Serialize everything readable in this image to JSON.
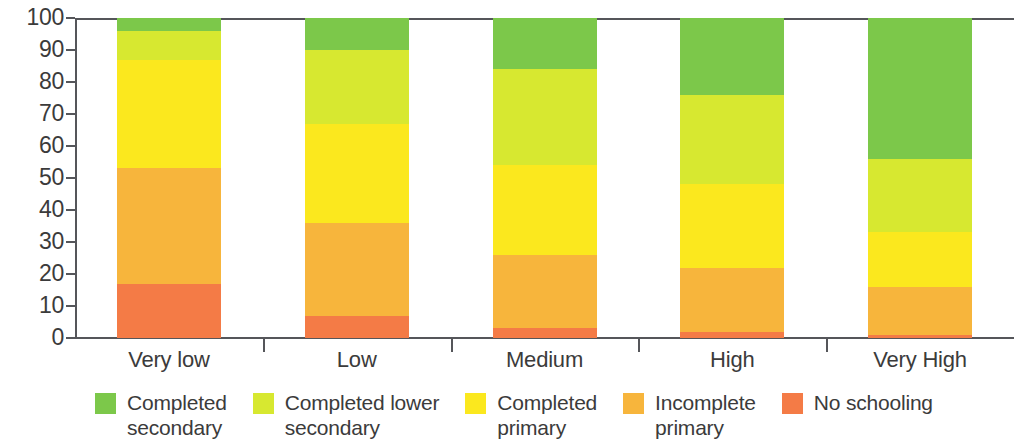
{
  "chart_data": {
    "type": "bar",
    "subtype": "stacked-bar-100",
    "title": "",
    "xlabel": "",
    "ylabel": "",
    "ylim": [
      0,
      100
    ],
    "ytick_step": 10,
    "yticks": [
      0,
      10,
      20,
      30,
      40,
      50,
      60,
      70,
      80,
      90,
      100
    ],
    "ytick_labels": [
      "0",
      "10",
      "20",
      "30",
      "40",
      "50",
      "60",
      "70",
      "80",
      "90",
      "100"
    ],
    "grid": false,
    "legend_position": "bottom",
    "categories": [
      "Very low",
      "Low",
      "Medium",
      "High",
      "Very High"
    ],
    "series": [
      {
        "name": "No schooling",
        "color": "#f47b46",
        "values": [
          17,
          7,
          3,
          2,
          1
        ]
      },
      {
        "name": "Incomplete primary",
        "color": "#f7b53c",
        "values": [
          36,
          29,
          23,
          20,
          15
        ]
      },
      {
        "name": "Completed primary",
        "color": "#fbe81e",
        "values": [
          34,
          31,
          28,
          26,
          17
        ]
      },
      {
        "name": "Completed lower secondary",
        "color": "#d7e830",
        "values": [
          9,
          23,
          30,
          28,
          23
        ]
      },
      {
        "name": "Completed secondary",
        "color": "#7cc84a",
        "values": [
          4,
          10,
          16,
          24,
          44
        ]
      }
    ]
  },
  "legend": {
    "items": [
      {
        "label": "Completed\nsecondary",
        "color": "#7cc84a"
      },
      {
        "label": "Completed lower\nsecondary",
        "color": "#d7e830"
      },
      {
        "label": "Completed\nprimary",
        "color": "#fbe81e"
      },
      {
        "label": "Incomplete\nprimary",
        "color": "#f7b53c"
      },
      {
        "label": "No schooling",
        "color": "#f47b46"
      }
    ]
  },
  "axis": {
    "line_color": "#55565a"
  }
}
